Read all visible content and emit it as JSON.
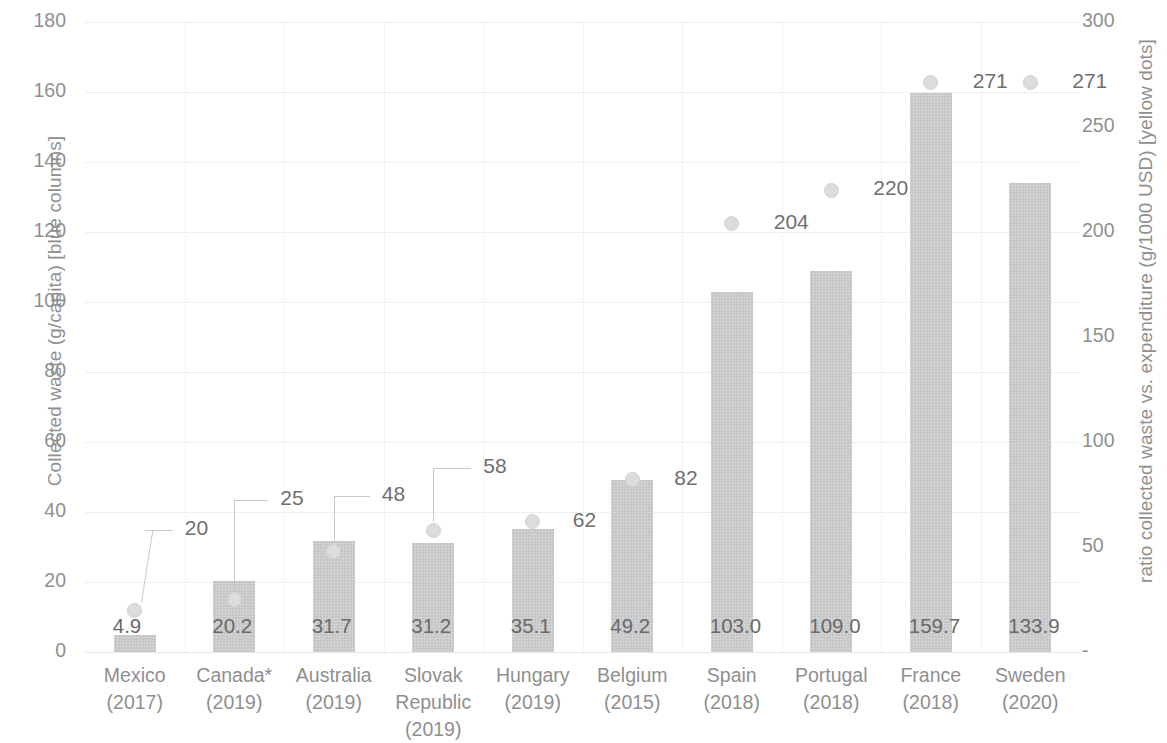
{
  "chart_data": {
    "type": "bar",
    "title": "",
    "subtitle": "",
    "xlabel": "",
    "ylabel": "Collected waste (g/capita) [blue columns]",
    "y2label": "ratio collected waste vs. expenditure (g/1000 USD) [yellow dots]",
    "grid": true,
    "legend_position": "none",
    "ylim": [
      0,
      180
    ],
    "y2lim": [
      0,
      300
    ],
    "yticks": [
      "0",
      "20",
      "40",
      "60",
      "80",
      "100",
      "120",
      "140",
      "160",
      "180"
    ],
    "y2ticks": [
      "-",
      "50",
      "100",
      "150",
      "200",
      "250",
      "300"
    ],
    "categories": [
      "Mexico\n(2017)",
      "Canada*\n(2019)",
      "Australia\n(2019)",
      "Slovak\nRepublic\n(2019)",
      "Hungary\n(2019)",
      "Belgium\n(2015)",
      "Spain\n(2018)",
      "Portugal\n(2018)",
      "France\n(2018)",
      "Sweden\n(2020)"
    ],
    "series": [
      {
        "name": "Collected waste (g/capita)",
        "kind": "bar",
        "axis": "left",
        "color": "#c3c5c6",
        "values": [
          4.9,
          20.2,
          31.7,
          31.2,
          35.1,
          49.2,
          103.0,
          109.0,
          159.7,
          133.9
        ],
        "labels": [
          "4.9",
          "20.2",
          "31.7",
          "31.2",
          "35.1",
          "49.2",
          "103.0",
          "109.0",
          "159.7",
          "133.9"
        ]
      },
      {
        "name": "ratio collected waste vs. expenditure (g/1000 USD)",
        "kind": "scatter",
        "axis": "right",
        "color": "#dcdcdc",
        "values": [
          20,
          25,
          48,
          58,
          62,
          82,
          204,
          220,
          271,
          271
        ],
        "labels": [
          "20",
          "25",
          "48",
          "58",
          "62",
          "82",
          "204",
          "220",
          "271",
          "271"
        ]
      }
    ]
  },
  "axes": {
    "left_title": "Collected waste (g/capita) [blue columns]",
    "right_title": "ratio collected waste vs. expenditure (g/1000 USD) [yellow dots]",
    "left_ticks": [
      "180",
      "160",
      "140",
      "120",
      "100",
      "80",
      "60",
      "40",
      "20",
      "0"
    ],
    "right_ticks": [
      "300",
      "250",
      "200",
      "150",
      "100",
      "50",
      "-"
    ]
  },
  "points": [
    {
      "cat": "Mexico\n(2017)",
      "bar": "4.9",
      "dot": "20"
    },
    {
      "cat": "Canada*\n(2019)",
      "bar": "20.2",
      "dot": "25"
    },
    {
      "cat": "Australia\n(2019)",
      "bar": "31.7",
      "dot": "48"
    },
    {
      "cat": "Slovak\nRepublic\n(2019)",
      "bar": "31.2",
      "dot": "58"
    },
    {
      "cat": "Hungary\n(2019)",
      "bar": "35.1",
      "dot": "62"
    },
    {
      "cat": "Belgium\n(2015)",
      "bar": "49.2",
      "dot": "82"
    },
    {
      "cat": "Spain\n(2018)",
      "bar": "103.0",
      "dot": "204"
    },
    {
      "cat": "Portugal\n(2018)",
      "bar": "109.0",
      "dot": "220"
    },
    {
      "cat": "France\n(2018)",
      "bar": "159.7",
      "dot": "271"
    },
    {
      "cat": "Sweden\n(2020)",
      "bar": "133.9",
      "dot": "271"
    }
  ]
}
